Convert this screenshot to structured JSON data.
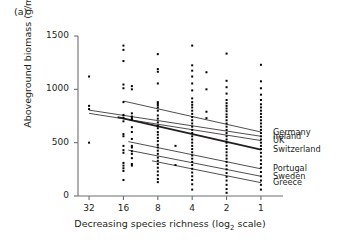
{
  "panel": {
    "label": "(a)"
  },
  "chart_data": {
    "type": "scatter",
    "title": "",
    "xlabel": "Decreasing species richness (log₂ scale)",
    "ylabel": "Aboveground biomass (g/m²)",
    "ylabel_main": "Aboveground biomass (g/m",
    "ylabel_sup": "2",
    "ylabel_tail": ")",
    "xlabel_main": "Decreasing species richness (log",
    "xlabel_sub": "2",
    "xlabel_tail": " scale)",
    "xlim": [
      40,
      0.85
    ],
    "ylim": [
      0,
      1500
    ],
    "xscale": "log2-decreasing",
    "grid": false,
    "legend_position": "right-inside",
    "xticks": [
      {
        "value": 32,
        "label": "32"
      },
      {
        "value": 16,
        "label": "16"
      },
      {
        "value": 8,
        "label": "8"
      },
      {
        "value": 4,
        "label": "4"
      },
      {
        "value": 2,
        "label": "2"
      },
      {
        "value": 1,
        "label": "1"
      }
    ],
    "yticks": [
      {
        "value": 0,
        "label": "0"
      },
      {
        "value": 500,
        "label": "500"
      },
      {
        "value": 1000,
        "label": "1000"
      },
      {
        "value": 1500,
        "label": "1500"
      }
    ],
    "marker": {
      "shape": "square",
      "size": 2,
      "color": "#000000"
    },
    "points": [
      {
        "x": 32,
        "y": 1120
      },
      {
        "x": 32,
        "y": 845
      },
      {
        "x": 32,
        "y": 815
      },
      {
        "x": 32,
        "y": 500
      },
      {
        "x": 16,
        "y": 1410
      },
      {
        "x": 16,
        "y": 1370
      },
      {
        "x": 16,
        "y": 1265
      },
      {
        "x": 16,
        "y": 1045
      },
      {
        "x": 16,
        "y": 1010
      },
      {
        "x": 16,
        "y": 880
      },
      {
        "x": 16,
        "y": 760
      },
      {
        "x": 16,
        "y": 735
      },
      {
        "x": 16,
        "y": 700
      },
      {
        "x": 16,
        "y": 580
      },
      {
        "x": 16,
        "y": 560
      },
      {
        "x": 16,
        "y": 470
      },
      {
        "x": 16,
        "y": 430
      },
      {
        "x": 16,
        "y": 405
      },
      {
        "x": 16,
        "y": 310
      },
      {
        "x": 16,
        "y": 285
      },
      {
        "x": 16,
        "y": 260
      },
      {
        "x": 16,
        "y": 235
      },
      {
        "x": 16,
        "y": 150
      },
      {
        "x": 13.5,
        "y": 1030
      },
      {
        "x": 13.5,
        "y": 1000
      },
      {
        "x": 13.5,
        "y": 775
      },
      {
        "x": 13.5,
        "y": 745
      },
      {
        "x": 13.5,
        "y": 730
      },
      {
        "x": 13.5,
        "y": 715
      },
      {
        "x": 13.5,
        "y": 645
      },
      {
        "x": 13.5,
        "y": 600
      },
      {
        "x": 13.5,
        "y": 535
      },
      {
        "x": 13.5,
        "y": 470
      },
      {
        "x": 13.5,
        "y": 455
      },
      {
        "x": 13.5,
        "y": 420
      },
      {
        "x": 13.5,
        "y": 395
      },
      {
        "x": 13.5,
        "y": 355
      },
      {
        "x": 13.5,
        "y": 300
      },
      {
        "x": 13.5,
        "y": 285
      },
      {
        "x": 8,
        "y": 1330
      },
      {
        "x": 8,
        "y": 1190
      },
      {
        "x": 8,
        "y": 1165
      },
      {
        "x": 8,
        "y": 1055
      },
      {
        "x": 8,
        "y": 880
      },
      {
        "x": 8,
        "y": 865
      },
      {
        "x": 8,
        "y": 850
      },
      {
        "x": 8,
        "y": 830
      },
      {
        "x": 8,
        "y": 800
      },
      {
        "x": 8,
        "y": 755
      },
      {
        "x": 8,
        "y": 725
      },
      {
        "x": 8,
        "y": 690
      },
      {
        "x": 8,
        "y": 660
      },
      {
        "x": 8,
        "y": 635
      },
      {
        "x": 8,
        "y": 600
      },
      {
        "x": 8,
        "y": 575
      },
      {
        "x": 8,
        "y": 545
      },
      {
        "x": 8,
        "y": 515
      },
      {
        "x": 8,
        "y": 480
      },
      {
        "x": 8,
        "y": 455
      },
      {
        "x": 8,
        "y": 425
      },
      {
        "x": 8,
        "y": 395
      },
      {
        "x": 8,
        "y": 360
      },
      {
        "x": 8,
        "y": 330
      },
      {
        "x": 8,
        "y": 300
      },
      {
        "x": 8,
        "y": 265
      },
      {
        "x": 8,
        "y": 230
      },
      {
        "x": 8,
        "y": 195
      },
      {
        "x": 8,
        "y": 160
      },
      {
        "x": 8,
        "y": 130
      },
      {
        "x": 5.6,
        "y": 470
      },
      {
        "x": 5.6,
        "y": 290
      },
      {
        "x": 4,
        "y": 1410
      },
      {
        "x": 4,
        "y": 1225
      },
      {
        "x": 4,
        "y": 1175
      },
      {
        "x": 4,
        "y": 1120
      },
      {
        "x": 4,
        "y": 1055
      },
      {
        "x": 4,
        "y": 990
      },
      {
        "x": 4,
        "y": 915
      },
      {
        "x": 4,
        "y": 880
      },
      {
        "x": 4,
        "y": 855
      },
      {
        "x": 4,
        "y": 830
      },
      {
        "x": 4,
        "y": 800
      },
      {
        "x": 4,
        "y": 770
      },
      {
        "x": 4,
        "y": 740
      },
      {
        "x": 4,
        "y": 710
      },
      {
        "x": 4,
        "y": 680
      },
      {
        "x": 4,
        "y": 650
      },
      {
        "x": 4,
        "y": 620
      },
      {
        "x": 4,
        "y": 590
      },
      {
        "x": 4,
        "y": 560
      },
      {
        "x": 4,
        "y": 530
      },
      {
        "x": 4,
        "y": 500
      },
      {
        "x": 4,
        "y": 470
      },
      {
        "x": 4,
        "y": 440
      },
      {
        "x": 4,
        "y": 410
      },
      {
        "x": 4,
        "y": 380
      },
      {
        "x": 4,
        "y": 350
      },
      {
        "x": 4,
        "y": 320
      },
      {
        "x": 4,
        "y": 290
      },
      {
        "x": 4,
        "y": 255
      },
      {
        "x": 4,
        "y": 220
      },
      {
        "x": 4,
        "y": 185
      },
      {
        "x": 4,
        "y": 150
      },
      {
        "x": 4,
        "y": 110
      },
      {
        "x": 4,
        "y": 60
      },
      {
        "x": 3,
        "y": 1160
      },
      {
        "x": 3,
        "y": 1000
      },
      {
        "x": 3,
        "y": 790
      },
      {
        "x": 3,
        "y": 730
      },
      {
        "x": 2,
        "y": 1335
      },
      {
        "x": 2,
        "y": 1080
      },
      {
        "x": 2,
        "y": 1020
      },
      {
        "x": 2,
        "y": 960
      },
      {
        "x": 2,
        "y": 900
      },
      {
        "x": 2,
        "y": 870
      },
      {
        "x": 2,
        "y": 845
      },
      {
        "x": 2,
        "y": 820
      },
      {
        "x": 2,
        "y": 795
      },
      {
        "x": 2,
        "y": 765
      },
      {
        "x": 2,
        "y": 740
      },
      {
        "x": 2,
        "y": 710
      },
      {
        "x": 2,
        "y": 680
      },
      {
        "x": 2,
        "y": 650
      },
      {
        "x": 2,
        "y": 620
      },
      {
        "x": 2,
        "y": 590
      },
      {
        "x": 2,
        "y": 560
      },
      {
        "x": 2,
        "y": 530
      },
      {
        "x": 2,
        "y": 500
      },
      {
        "x": 2,
        "y": 470
      },
      {
        "x": 2,
        "y": 440
      },
      {
        "x": 2,
        "y": 410
      },
      {
        "x": 2,
        "y": 380
      },
      {
        "x": 2,
        "y": 350
      },
      {
        "x": 2,
        "y": 320
      },
      {
        "x": 2,
        "y": 285
      },
      {
        "x": 2,
        "y": 250
      },
      {
        "x": 2,
        "y": 215
      },
      {
        "x": 2,
        "y": 180
      },
      {
        "x": 2,
        "y": 145
      },
      {
        "x": 2,
        "y": 105
      },
      {
        "x": 2,
        "y": 65
      },
      {
        "x": 2,
        "y": 30
      },
      {
        "x": 1,
        "y": 1230
      },
      {
        "x": 1,
        "y": 1075
      },
      {
        "x": 1,
        "y": 1010
      },
      {
        "x": 1,
        "y": 950
      },
      {
        "x": 1,
        "y": 900
      },
      {
        "x": 1,
        "y": 860
      },
      {
        "x": 1,
        "y": 830
      },
      {
        "x": 1,
        "y": 800
      },
      {
        "x": 1,
        "y": 770
      },
      {
        "x": 1,
        "y": 740
      },
      {
        "x": 1,
        "y": 710
      },
      {
        "x": 1,
        "y": 680
      },
      {
        "x": 1,
        "y": 650
      },
      {
        "x": 1,
        "y": 620
      },
      {
        "x": 1,
        "y": 590
      },
      {
        "x": 1,
        "y": 560
      },
      {
        "x": 1,
        "y": 530
      },
      {
        "x": 1,
        "y": 500
      },
      {
        "x": 1,
        "y": 470
      },
      {
        "x": 1,
        "y": 440
      },
      {
        "x": 1,
        "y": 405
      },
      {
        "x": 1,
        "y": 370
      },
      {
        "x": 1,
        "y": 335
      },
      {
        "x": 1,
        "y": 300
      },
      {
        "x": 1,
        "y": 265
      },
      {
        "x": 1,
        "y": 225
      },
      {
        "x": 1,
        "y": 185
      },
      {
        "x": 1,
        "y": 145
      },
      {
        "x": 1,
        "y": 105
      },
      {
        "x": 1,
        "y": 60
      }
    ],
    "series": [
      {
        "name": "Germany",
        "x_start": 16,
        "y_start": 890,
        "x_end": 1,
        "y_end": 600,
        "width": 0.8
      },
      {
        "name": "Ireland",
        "x_start": 32,
        "y_start": 805,
        "x_end": 1,
        "y_end": 560,
        "width": 0.8
      },
      {
        "name": "UK",
        "x_start": 32,
        "y_start": 775,
        "x_end": 1,
        "y_end": 520,
        "width": 0.8
      },
      {
        "name": "Switzerland",
        "x_start": 18,
        "y_start": 740,
        "x_end": 1,
        "y_end": 435,
        "width": 1.8
      },
      {
        "name": "Portugal",
        "x_start": 14.5,
        "y_start": 510,
        "x_end": 1,
        "y_end": 255,
        "width": 0.8
      },
      {
        "name": "Sweden",
        "x_start": 14.5,
        "y_start": 430,
        "x_end": 1,
        "y_end": 185,
        "width": 0.8
      },
      {
        "name": "Greece",
        "x_start": 9,
        "y_start": 330,
        "x_end": 1,
        "y_end": 125,
        "width": 0.8
      }
    ],
    "legend": [
      {
        "label": "Germany"
      },
      {
        "label": "Ireland"
      },
      {
        "label": "UK"
      },
      {
        "label": "Switzerland"
      },
      {
        "label": "Portugal"
      },
      {
        "label": "Sweden"
      },
      {
        "label": "Greece"
      }
    ],
    "colors": {
      "axis": "#6d6e71",
      "marker": "#000000",
      "line": "#231f20",
      "text": "#231f20"
    }
  }
}
